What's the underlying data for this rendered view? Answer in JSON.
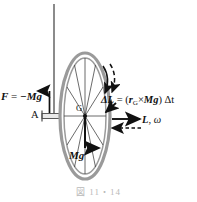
{
  "figure": {
    "caption": "図 11・14",
    "colors": {
      "ink": "#111111",
      "rim": "#9a9a9a",
      "rim_fill": "#d8d8d8",
      "spoke": "#3a3a3a",
      "axle": "#555555",
      "support": "#6e6e6e",
      "caption": "#b9b9b9"
    },
    "labels": {
      "force": {
        "symbol": "F",
        "equals": "=",
        "value": "−Mg",
        "text": "F = −Mg",
        "name": "support-force"
      },
      "pivot": {
        "text": "A",
        "name": "pivot-point-A"
      },
      "center_of_gravity": {
        "text": "G",
        "name": "center-of-gravity-G"
      },
      "weight": {
        "text": "Mg",
        "name": "weight-vector"
      },
      "delta_L": {
        "lhs": "ΔL",
        "equals": "=",
        "open": "(",
        "r": "r",
        "r_sub": "G",
        "cross": "×",
        "Mg": "Mg",
        "close": ")",
        "dt": "Δt",
        "text": "ΔL = (rG×Mg) Δt",
        "name": "delta-angular-momentum"
      },
      "L_omega": {
        "L": "L",
        "comma": ",",
        "omega": "ω",
        "text": "L, ω",
        "name": "angular-momentum-omega"
      }
    },
    "elements": {
      "support_line": "vertical-support-string",
      "support_arrow": "upward-force-arrow",
      "axle": "horizontal-axle-rod",
      "wheel": "spinning-wheel-ellipse",
      "spokes_count": 12,
      "weight_arrow": "downward-weight-arrow",
      "spin_arrow": "curved-dashed-spin-arrow",
      "L_arrow": "solid-right-angular-momentum-arrow",
      "precess_arrow": "dashed-left-precession-arrow",
      "dL_arrow": "short-diagonal-delta-L-arrow"
    }
  }
}
